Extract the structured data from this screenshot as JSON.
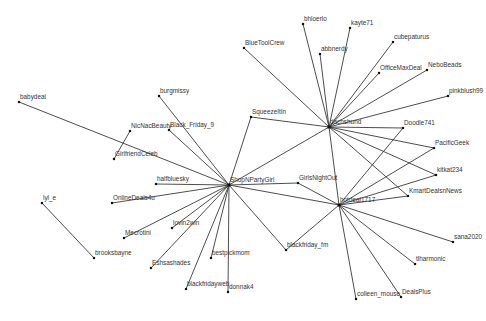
{
  "diagram": {
    "type": "network-graph",
    "colors": {
      "background": "#ffffff",
      "edge": "#3a3a3a",
      "node": "#111111",
      "label": "#333333"
    },
    "nodes": [
      {
        "id": "ShopNPartyGirl",
        "label": "ShopNPartyGirl",
        "x": 229,
        "y": 185,
        "hub": true
      },
      {
        "id": "dachshund",
        "label": "dachshund",
        "x": 329,
        "y": 127,
        "hub": true
      },
      {
        "id": "hotdeal1717",
        "label": "hotdeal1717",
        "x": 339,
        "y": 205,
        "hub": true
      },
      {
        "id": "babydeal",
        "label": "babydeal",
        "x": 19,
        "y": 102
      },
      {
        "id": "burgmissy",
        "label": "burgmissy",
        "x": 159,
        "y": 96
      },
      {
        "id": "NicNacBeauty",
        "label": "NicNacBeauty",
        "x": 130,
        "y": 131
      },
      {
        "id": "Black_Friday_9",
        "label": "Black_Friday_9",
        "x": 169,
        "y": 130
      },
      {
        "id": "GirlfriendCeleb",
        "label": "GirlfriendCeleb",
        "x": 114,
        "y": 159
      },
      {
        "id": "halfbluesky",
        "label": "halfbluesky",
        "x": 156,
        "y": 184
      },
      {
        "id": "OnlineDeals4u",
        "label": "OnlineDeals4u",
        "x": 112,
        "y": 203
      },
      {
        "id": "lyl_e",
        "label": "lyl_e",
        "x": 42,
        "y": 203
      },
      {
        "id": "brooksbayne",
        "label": "brooksbayne",
        "x": 94,
        "y": 258
      },
      {
        "id": "lovin2win",
        "label": "lovin2win",
        "x": 172,
        "y": 228
      },
      {
        "id": "Mecrotini",
        "label": "Mecrotini",
        "x": 124,
        "y": 238
      },
      {
        "id": "Eshsashades",
        "label": "Eshsashades",
        "x": 151,
        "y": 268
      },
      {
        "id": "bestpickmom",
        "label": "bestpickmom",
        "x": 211,
        "y": 258
      },
      {
        "id": "blackfridayweb",
        "label": "blackfridayweb",
        "x": 186,
        "y": 289
      },
      {
        "id": "donnak4",
        "label": "donnak4",
        "x": 228,
        "y": 292
      },
      {
        "id": "SqueezeItIn",
        "label": "SqueezeItIn",
        "x": 251,
        "y": 117
      },
      {
        "id": "BlueToolCrew",
        "label": "BlueToolCrew",
        "x": 244,
        "y": 48
      },
      {
        "id": "GirlsNightOut",
        "label": "GirlsNightOut",
        "x": 298,
        "y": 183
      },
      {
        "id": "blackfriday_fm",
        "label": "blackfriday_fm",
        "x": 286,
        "y": 250
      },
      {
        "id": "bhloerlo",
        "label": "bhloerlo",
        "x": 303,
        "y": 24
      },
      {
        "id": "kayte71",
        "label": "kayte71",
        "x": 350,
        "y": 28
      },
      {
        "id": "abbnerdy",
        "label": "abbnerdy",
        "x": 320,
        "y": 54
      },
      {
        "id": "cubepaturus",
        "label": "cubepaturus",
        "x": 393,
        "y": 42
      },
      {
        "id": "OfficeMaxDeal",
        "label": "OfficeMaxDeal",
        "x": 379,
        "y": 73
      },
      {
        "id": "NeboBeads",
        "label": "NeboBeads",
        "x": 427,
        "y": 70
      },
      {
        "id": "pinkblush99",
        "label": "pinkblush99",
        "x": 448,
        "y": 96
      },
      {
        "id": "Doodle741",
        "label": "Doodle741",
        "x": 403,
        "y": 128
      },
      {
        "id": "PacificGeek",
        "label": "PacificGeek",
        "x": 434,
        "y": 148
      },
      {
        "id": "kitkat234",
        "label": "kitkat234",
        "x": 436,
        "y": 175
      },
      {
        "id": "KmartDealsnNews",
        "label": "KmartDealsnNews",
        "x": 408,
        "y": 196
      },
      {
        "id": "sana2020",
        "label": "sana2020",
        "x": 453,
        "y": 242
      },
      {
        "id": "tlharmonic",
        "label": "tlharmonic",
        "x": 415,
        "y": 264
      },
      {
        "id": "DealsPlus",
        "label": "DealsPlus",
        "x": 401,
        "y": 297
      },
      {
        "id": "colleen_mouse",
        "label": "colleen_mouse",
        "x": 356,
        "y": 299
      }
    ],
    "edges": [
      [
        "ShopNPartyGirl",
        "babydeal"
      ],
      [
        "ShopNPartyGirl",
        "burgmissy"
      ],
      [
        "ShopNPartyGirl",
        "Black_Friday_9"
      ],
      [
        "ShopNPartyGirl",
        "halfbluesky"
      ],
      [
        "ShopNPartyGirl",
        "OnlineDeals4u"
      ],
      [
        "ShopNPartyGirl",
        "lovin2win"
      ],
      [
        "ShopNPartyGirl",
        "Mecrotini"
      ],
      [
        "ShopNPartyGirl",
        "Eshsashades"
      ],
      [
        "ShopNPartyGirl",
        "bestpickmom"
      ],
      [
        "ShopNPartyGirl",
        "blackfridayweb"
      ],
      [
        "ShopNPartyGirl",
        "donnak4"
      ],
      [
        "ShopNPartyGirl",
        "SqueezeItIn"
      ],
      [
        "ShopNPartyGirl",
        "GirlsNightOut"
      ],
      [
        "ShopNPartyGirl",
        "blackfriday_fm"
      ],
      [
        "ShopNPartyGirl",
        "dachshund"
      ],
      [
        "ShopNPartyGirl",
        "hotdeal1717"
      ],
      [
        "NicNacBeauty",
        "GirlfriendCeleb"
      ],
      [
        "lyl_e",
        "brooksbayne"
      ],
      [
        "dachshund",
        "BlueToolCrew"
      ],
      [
        "dachshund",
        "bhloerlo"
      ],
      [
        "dachshund",
        "kayte71"
      ],
      [
        "dachshund",
        "abbnerdy"
      ],
      [
        "dachshund",
        "cubepaturus"
      ],
      [
        "dachshund",
        "OfficeMaxDeal"
      ],
      [
        "dachshund",
        "NeboBeads"
      ],
      [
        "dachshund",
        "pinkblush99"
      ],
      [
        "dachshund",
        "Doodle741"
      ],
      [
        "dachshund",
        "PacificGeek"
      ],
      [
        "dachshund",
        "kitkat234"
      ],
      [
        "dachshund",
        "KmartDealsnNews"
      ],
      [
        "dachshund",
        "SqueezeItIn"
      ],
      [
        "dachshund",
        "hotdeal1717"
      ],
      [
        "hotdeal1717",
        "GirlsNightOut"
      ],
      [
        "hotdeal1717",
        "blackfriday_fm"
      ],
      [
        "hotdeal1717",
        "Doodle741"
      ],
      [
        "hotdeal1717",
        "PacificGeek"
      ],
      [
        "hotdeal1717",
        "kitkat234"
      ],
      [
        "hotdeal1717",
        "KmartDealsnNews"
      ],
      [
        "hotdeal1717",
        "sana2020"
      ],
      [
        "hotdeal1717",
        "tlharmonic"
      ],
      [
        "hotdeal1717",
        "DealsPlus"
      ],
      [
        "hotdeal1717",
        "colleen_mouse"
      ]
    ]
  }
}
